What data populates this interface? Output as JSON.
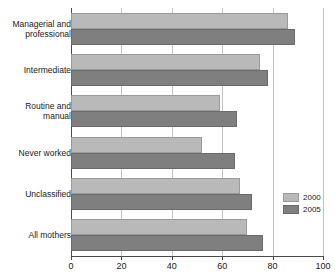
{
  "chart_data": {
    "type": "bar",
    "orientation": "horizontal",
    "title": "",
    "subtitle": "",
    "xlabel": "",
    "ylabel": "",
    "xlim": [
      0,
      100
    ],
    "xticks": [
      0,
      20,
      40,
      60,
      80,
      100
    ],
    "xtick_labels": [
      "0",
      "20",
      "40",
      "60",
      "80",
      "100"
    ],
    "grid": "vertical",
    "legend_position": "right-middle",
    "categories": [
      "Managerial and\nprofessional",
      "Intermediate",
      "Routine and\nmanual",
      "Never worked",
      "Unclassified",
      "All mothers"
    ],
    "series": [
      {
        "name": "2000",
        "color": "#b9b9b9",
        "values": [
          86,
          75,
          59,
          52,
          67,
          70
        ]
      },
      {
        "name": "2005",
        "color": "#7f7f7f",
        "values": [
          89,
          78,
          66,
          65,
          72,
          76
        ]
      }
    ]
  },
  "legend": {
    "items": [
      {
        "label": "2000",
        "swatch": "#b9b9b9"
      },
      {
        "label": "2005",
        "swatch": "#7f7f7f"
      }
    ]
  },
  "colors": {
    "series_2000": "#b9b9b9",
    "series_2005": "#7f7f7f",
    "gridline": "#c3c3c3",
    "axis": "#4a4a4a",
    "background": "#ffffff",
    "text": "#1a1a1a"
  }
}
